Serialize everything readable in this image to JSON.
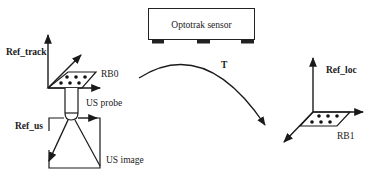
{
  "diagram": {
    "sensor": {
      "label": "Optotrak sensor"
    },
    "frames": {
      "ref_track": "Ref_track",
      "ref_us": "Ref_us",
      "ref_loc": "Ref_loc"
    },
    "rigid_bodies": {
      "rb0": "RB0",
      "rb1": "RB1"
    },
    "probe": {
      "label": "US probe"
    },
    "image": {
      "label": "US image"
    },
    "transform": {
      "label": "T"
    },
    "colors": {
      "ink": "#1a1a1a",
      "background": "#ffffff"
    }
  }
}
